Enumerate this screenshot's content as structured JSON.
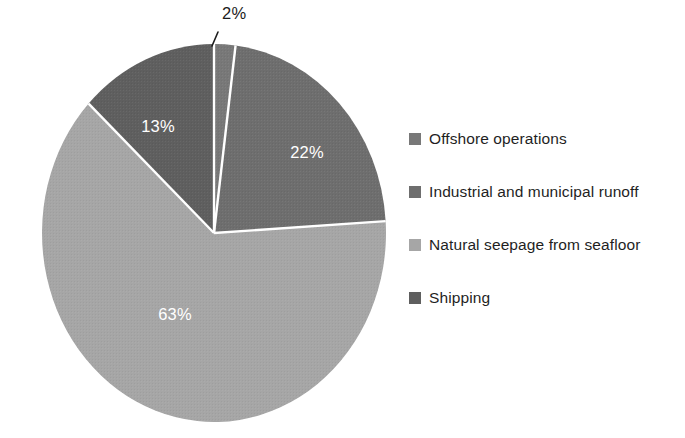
{
  "chart_data": {
    "type": "pie",
    "title": "",
    "subtitle": "",
    "xlabel": "",
    "ylabel": "",
    "legend_position": "right",
    "grid": false,
    "start_angle_deg": 0,
    "direction": "clockwise",
    "categories": [
      "Offshore operations",
      "Industrial and municipal runoff",
      "Natural seepage from seafloor",
      "Shipping"
    ],
    "values": [
      2,
      22,
      63,
      13
    ],
    "value_labels": [
      "2%",
      "22%",
      "63%",
      "13%"
    ],
    "colors": [
      "#787878",
      "#6e6e6e",
      "#a6a6a6",
      "#5f5f5f"
    ],
    "slices": [
      {
        "label": "Offshore operations",
        "value": 2,
        "value_label": "2%",
        "color": "#787878",
        "label_placement": "outside-callout",
        "label_x": 232,
        "label_y": 18
      },
      {
        "label": "Industrial and municipal runoff",
        "value": 22,
        "value_label": "22%",
        "color": "#6e6e6e",
        "label_placement": "inside",
        "label_x": 307,
        "label_y": 158
      },
      {
        "label": "Natural seepage from seafloor",
        "value": 63,
        "value_label": "63%",
        "color": "#a6a6a6",
        "label_placement": "inside",
        "label_x": 175,
        "label_y": 320
      },
      {
        "label": "Shipping",
        "value": 13,
        "value_label": "13%",
        "color": "#5f5f5f",
        "label_placement": "inside",
        "label_x": 158,
        "label_y": 132
      }
    ]
  },
  "pie": {
    "center_x": 214,
    "center_y": 233,
    "radius_x": 172,
    "radius_y": 189,
    "separator_color": "#ffffff",
    "separator_width": 2.4,
    "callout": {
      "text": "2%",
      "line_color": "#1c1c1c",
      "line_x1": 218,
      "line_y1": 32,
      "line_x2": 212,
      "line_y2": 46
    },
    "labels": {
      "two": "2%",
      "twentytwo": "22%",
      "sixtythree": "63%",
      "thirteen": "13%"
    }
  },
  "legend": {
    "items": [
      {
        "label": "Offshore operations",
        "color": "#787878"
      },
      {
        "label": "Industrial and municipal runoff",
        "color": "#6e6e6e"
      },
      {
        "label": "Natural seepage from seafloor",
        "color": "#a6a6a6"
      },
      {
        "label": "Shipping",
        "color": "#5f5f5f"
      }
    ]
  }
}
